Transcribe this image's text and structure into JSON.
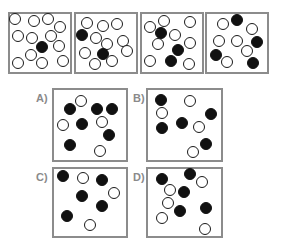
{
  "sequence": [
    {
      "id": "panel-1",
      "white_count": 12,
      "black_count": 1,
      "circles": [
        {
          "fill": "white",
          "pos": [
            15,
            19
          ]
        },
        {
          "fill": "white",
          "pos": [
            34,
            21
          ]
        },
        {
          "fill": "white",
          "pos": [
            48,
            19
          ]
        },
        {
          "fill": "white",
          "pos": [
            60,
            27
          ]
        },
        {
          "fill": "white",
          "pos": [
            18,
            36
          ]
        },
        {
          "fill": "white",
          "pos": [
            32,
            38
          ]
        },
        {
          "fill": "white",
          "pos": [
            51,
            36
          ]
        },
        {
          "fill": "black",
          "pos": [
            42,
            47
          ]
        },
        {
          "fill": "white",
          "pos": [
            59,
            46
          ]
        },
        {
          "fill": "white",
          "pos": [
            31,
            55
          ]
        },
        {
          "fill": "white",
          "pos": [
            18,
            63
          ]
        },
        {
          "fill": "white",
          "pos": [
            42,
            63
          ]
        },
        {
          "fill": "white",
          "pos": [
            63,
            61
          ]
        }
      ]
    },
    {
      "id": "panel-2",
      "white_count": 10,
      "black_count": 2,
      "circles": [
        {
          "fill": "white",
          "pos": [
            87,
            23
          ]
        },
        {
          "fill": "white",
          "pos": [
            103,
            26
          ]
        },
        {
          "fill": "white",
          "pos": [
            117,
            24
          ]
        },
        {
          "fill": "black",
          "pos": [
            82,
            35
          ]
        },
        {
          "fill": "white",
          "pos": [
            96,
            38
          ]
        },
        {
          "fill": "white",
          "pos": [
            107,
            44
          ]
        },
        {
          "fill": "white",
          "pos": [
            123,
            41
          ]
        },
        {
          "fill": "white",
          "pos": [
            85,
            53
          ]
        },
        {
          "fill": "black",
          "pos": [
            103,
            54
          ]
        },
        {
          "fill": "white",
          "pos": [
            127,
            51
          ]
        },
        {
          "fill": "white",
          "pos": [
            95,
            64
          ]
        },
        {
          "fill": "white",
          "pos": [
            112,
            61
          ]
        }
      ]
    },
    {
      "id": "panel-3",
      "white_count": 8,
      "black_count": 3,
      "circles": [
        {
          "fill": "white",
          "pos": [
            150,
            27
          ]
        },
        {
          "fill": "white",
          "pos": [
            164,
            21
          ]
        },
        {
          "fill": "white",
          "pos": [
            190,
            22
          ]
        },
        {
          "fill": "black",
          "pos": [
            161,
            33
          ]
        },
        {
          "fill": "white",
          "pos": [
            175,
            35
          ]
        },
        {
          "fill": "white",
          "pos": [
            158,
            44
          ]
        },
        {
          "fill": "black",
          "pos": [
            178,
            50
          ]
        },
        {
          "fill": "white",
          "pos": [
            190,
            43
          ]
        },
        {
          "fill": "white",
          "pos": [
            150,
            61
          ]
        },
        {
          "fill": "black",
          "pos": [
            171,
            61
          ]
        },
        {
          "fill": "white",
          "pos": [
            189,
            64
          ]
        }
      ]
    },
    {
      "id": "panel-4",
      "white_count": 6,
      "black_count": 4,
      "circles": [
        {
          "fill": "black",
          "pos": [
            237,
            20
          ]
        },
        {
          "fill": "white",
          "pos": [
            223,
            24
          ]
        },
        {
          "fill": "white",
          "pos": [
            252,
            29
          ]
        },
        {
          "fill": "white",
          "pos": [
            219,
            41
          ]
        },
        {
          "fill": "white",
          "pos": [
            237,
            41
          ]
        },
        {
          "fill": "black",
          "pos": [
            257,
            42
          ]
        },
        {
          "fill": "black",
          "pos": [
            216,
            55
          ]
        },
        {
          "fill": "white",
          "pos": [
            247,
            51
          ]
        },
        {
          "fill": "white",
          "pos": [
            227,
            62
          ]
        },
        {
          "fill": "black",
          "pos": [
            253,
            63
          ]
        }
      ]
    }
  ],
  "options": [
    {
      "label": "A)",
      "white_count": 4,
      "black_count": 6,
      "circles": [
        {
          "fill": "white",
          "pos": [
            81,
            101
          ]
        },
        {
          "fill": "black",
          "pos": [
            70,
            109
          ]
        },
        {
          "fill": "black",
          "pos": [
            97,
            109
          ]
        },
        {
          "fill": "black",
          "pos": [
            112,
            109
          ]
        },
        {
          "fill": "white",
          "pos": [
            63,
            125
          ]
        },
        {
          "fill": "black",
          "pos": [
            82,
            124
          ]
        },
        {
          "fill": "white",
          "pos": [
            102,
            122
          ]
        },
        {
          "fill": "black",
          "pos": [
            109,
            135
          ]
        },
        {
          "fill": "black",
          "pos": [
            70,
            145
          ]
        },
        {
          "fill": "white",
          "pos": [
            100,
            151
          ]
        }
      ]
    },
    {
      "label": "B)",
      "white_count": 4,
      "black_count": 5,
      "circles": [
        {
          "fill": "black",
          "pos": [
            161,
            100
          ]
        },
        {
          "fill": "white",
          "pos": [
            190,
            101
          ]
        },
        {
          "fill": "white",
          "pos": [
            162,
            113
          ]
        },
        {
          "fill": "black",
          "pos": [
            211,
            114
          ]
        },
        {
          "fill": "black",
          "pos": [
            182,
            123
          ]
        },
        {
          "fill": "black",
          "pos": [
            162,
            128
          ]
        },
        {
          "fill": "white",
          "pos": [
            199,
            127
          ]
        },
        {
          "fill": "black",
          "pos": [
            206,
            144
          ]
        },
        {
          "fill": "white",
          "pos": [
            193,
            152
          ]
        }
      ]
    },
    {
      "label": "C)",
      "white_count": 3,
      "black_count": 5,
      "circles": [
        {
          "fill": "black",
          "pos": [
            63,
            176
          ]
        },
        {
          "fill": "white",
          "pos": [
            83,
            178
          ]
        },
        {
          "fill": "black",
          "pos": [
            102,
            180
          ]
        },
        {
          "fill": "white",
          "pos": [
            114,
            193
          ]
        },
        {
          "fill": "black",
          "pos": [
            82,
            196
          ]
        },
        {
          "fill": "black",
          "pos": [
            102,
            206
          ]
        },
        {
          "fill": "black",
          "pos": [
            67,
            216
          ]
        },
        {
          "fill": "white",
          "pos": [
            90,
            225
          ]
        }
      ]
    },
    {
      "label": "D)",
      "white_count": 5,
      "black_count": 5,
      "circles": [
        {
          "fill": "black",
          "pos": [
            162,
            179
          ]
        },
        {
          "fill": "black",
          "pos": [
            190,
            174
          ]
        },
        {
          "fill": "white",
          "pos": [
            202,
            182
          ]
        },
        {
          "fill": "white",
          "pos": [
            170,
            190
          ]
        },
        {
          "fill": "black",
          "pos": [
            184,
            192
          ]
        },
        {
          "fill": "white",
          "pos": [
            168,
            203
          ]
        },
        {
          "fill": "black",
          "pos": [
            180,
            211
          ]
        },
        {
          "fill": "black",
          "pos": [
            206,
            208
          ]
        },
        {
          "fill": "white",
          "pos": [
            162,
            218
          ]
        },
        {
          "fill": "white",
          "pos": [
            205,
            229
          ]
        }
      ]
    }
  ],
  "colors": {
    "border": "#8c8c8c",
    "label": "#8a8a8a",
    "black_fill": "#111111",
    "white_fill": "#ffffff"
  }
}
